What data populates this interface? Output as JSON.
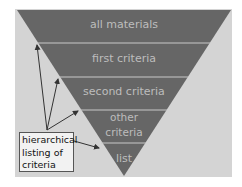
{
  "diagram": {
    "type": "inverted-pyramid",
    "bands": [
      {
        "label": "all materials"
      },
      {
        "label": "first criteria"
      },
      {
        "label": "second criteria"
      },
      {
        "label_line1": "other",
        "label_line2": "criteria"
      },
      {
        "label": "list"
      }
    ],
    "callout": {
      "line1": "hierarchical",
      "line2": "listing of",
      "line3": "criteria"
    },
    "colors": {
      "background": "#d4d4d4",
      "band_fill": "#666666",
      "separator": "#c8c8c8",
      "band_text": "#bdbdbd",
      "arrow": "#333333",
      "callout_fill": "#f2f2f2"
    }
  }
}
